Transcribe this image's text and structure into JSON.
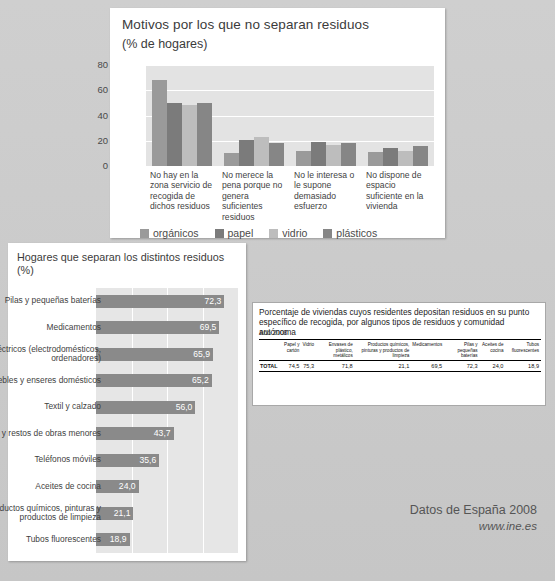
{
  "vertical_chart": {
    "title": "Motivos por los que no separan residuos",
    "subtitle": "(% de hogares)",
    "legend": [
      {
        "label": "orgánicos",
        "color": "#9a9a9a"
      },
      {
        "label": "papel",
        "color": "#7b7b7b"
      },
      {
        "label": "vidrio",
        "color": "#bdbdbd"
      },
      {
        "label": "plásticos",
        "color": "#868686"
      }
    ]
  },
  "horizontal_chart": {
    "title": "Hogares que separan los distintos residuos (%)"
  },
  "table": {
    "title": "Porcentaje de viviendas cuyos residentes depositan residuos en su punto específico de recogida, por algunos tipos de residuos y comunidad autónoma",
    "year": "Año 2008",
    "corner": "",
    "headers": [
      "Papel y cartón",
      "Vidrio",
      "Envases de plástico, metálicos",
      "Productos químicos, pinturas y productos de limpieza",
      "Medicamentos",
      "Pilas y pequeñas baterías",
      "Aceites de cocina",
      "Tubos fluorescentes"
    ],
    "rows": [
      {
        "label": "TOTAL",
        "values": [
          "74,5",
          "75,3",
          "71,8",
          "21,1",
          "69,5",
          "72,3",
          "24,0",
          "18,9"
        ]
      }
    ]
  },
  "footer": {
    "line1": "Datos de España 2008",
    "line2": "www.ine.es"
  },
  "chart_data": [
    {
      "type": "bar",
      "title": "Motivos por los que no separan residuos",
      "subtitle": "(% de hogares)",
      "xlabel": "",
      "ylabel": "% de hogares",
      "ylim": [
        0,
        80
      ],
      "yticks": [
        0,
        20,
        40,
        60,
        80
      ],
      "grid": true,
      "legend_position": "bottom",
      "categories": [
        "No hay en la zona servicio de recogida de dichos residuos",
        "No merece la pena porque no genera suficientes residuos",
        "No le interesa o le supone demasiado esfuerzo",
        "No dispone de espacio suficiente en la vivienda"
      ],
      "series": [
        {
          "name": "orgánicos",
          "color": "#9a9a9a",
          "values": [
            68,
            10,
            12,
            11
          ]
        },
        {
          "name": "papel",
          "color": "#7b7b7b",
          "values": [
            50,
            21,
            19,
            14
          ]
        },
        {
          "name": "vidrio",
          "color": "#bdbdbd",
          "values": [
            48,
            23,
            17,
            12
          ]
        },
        {
          "name": "plásticos",
          "color": "#868686",
          "values": [
            50,
            18,
            18,
            16
          ]
        }
      ]
    },
    {
      "type": "bar",
      "orientation": "horizontal",
      "title": "Hogares que separan los distintos residuos (%)",
      "xlabel": "",
      "ylabel": "",
      "xlim": [
        0,
        80
      ],
      "grid": true,
      "categories": [
        "Pilas y pequeñas baterías",
        "Medicamentos",
        "Aparatos eléctricos (electrodomésticos, ordenadores)",
        "Muebles y enseres domésticos",
        "Textil y calzado",
        "Escombros y restos de obras menores",
        "Teléfonos móviles",
        "Aceites de cocina",
        "Productos químicos, pinturas y productos de limpieza",
        "Tubos fluorescentes"
      ],
      "values": [
        72.3,
        69.5,
        65.9,
        65.2,
        56.0,
        43.7,
        35.6,
        24.0,
        21.1,
        18.9
      ],
      "value_labels": [
        "72,3",
        "69,5",
        "65,9",
        "65,2",
        "56,0",
        "43,7",
        "35,6",
        "24,0",
        "21,1",
        "18,9"
      ],
      "bar_color": "#8a8a8a"
    },
    {
      "type": "table",
      "title": "Porcentaje de viviendas cuyos residentes depositan residuos en su punto específico de recogida, por algunos tipos de residuos y comunidad autónoma",
      "subtitle": "Año 2008",
      "columns": [
        "Papel y cartón",
        "Vidrio",
        "Envases de plástico, metálicos",
        "Productos químicos, pinturas y productos de limpieza",
        "Medicamentos",
        "Pilas y pequeñas baterías",
        "Aceites de cocina",
        "Tubos fluorescentes"
      ],
      "rows": [
        {
          "TOTAL": [
            74.5,
            75.3,
            71.8,
            21.1,
            69.5,
            72.3,
            24.0,
            18.9
          ]
        }
      ]
    }
  ]
}
